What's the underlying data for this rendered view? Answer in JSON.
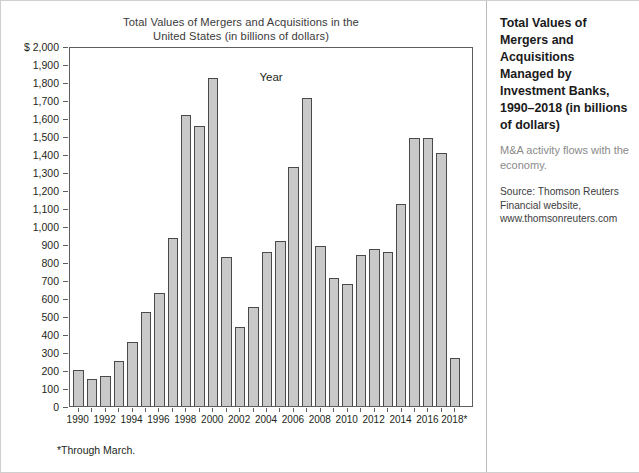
{
  "figure": {
    "chart_title_line1": "Total Values of Mergers and Acquisitions in the",
    "chart_title_line2": "United States (in billions of dollars)",
    "footnote": "*Through March."
  },
  "sidebar": {
    "title": "Total Values of Mergers and Acquisitions Managed by Investment Banks, 1990–2018 (in billions of dollars)",
    "description": "M&A activity flows with the economy.",
    "source": "Source: Thomson Reuters Financial website, www.thomsonreuters.com"
  },
  "chart_data": {
    "type": "bar",
    "title": "Total Values of Mergers and Acquisitions in the United States (in billions of dollars)",
    "xlabel": "Year",
    "ylabel": "$",
    "ylim": [
      0,
      2000
    ],
    "ytick_step": 100,
    "grid": false,
    "legend": null,
    "y_tick_labels": [
      "$ 2,000",
      "1,900",
      "1,800",
      "1,700",
      "1,600",
      "1,500",
      "1,400",
      "1,300",
      "1,200",
      "1,100",
      "1,000",
      "900",
      "800",
      "700",
      "600",
      "500",
      "400",
      "300",
      "200",
      "100",
      "0"
    ],
    "x_tick_labels": [
      "1990",
      "1992",
      "1994",
      "1996",
      "1998",
      "2000",
      "2002",
      "2004",
      "2006",
      "2008",
      "2010",
      "2012",
      "2014",
      "2016",
      "2018*"
    ],
    "categories": [
      "1990",
      "1991",
      "1992",
      "1993",
      "1994",
      "1995",
      "1996",
      "1997",
      "1998",
      "1999",
      "2000",
      "2001",
      "2002",
      "2003",
      "2004",
      "2005",
      "2006",
      "2007",
      "2008",
      "2009",
      "2010",
      "2011",
      "2012",
      "2013",
      "2014",
      "2015",
      "2016",
      "2017",
      "2018*"
    ],
    "values": [
      198,
      150,
      165,
      248,
      353,
      520,
      630,
      935,
      1615,
      1555,
      1825,
      830,
      440,
      550,
      855,
      915,
      1330,
      1710,
      890,
      710,
      680,
      840,
      870,
      855,
      1120,
      1490,
      1490,
      1405,
      265
    ],
    "annotations": [
      "*Through March."
    ]
  }
}
